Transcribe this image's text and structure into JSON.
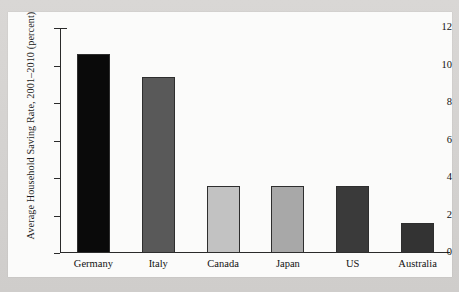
{
  "figure": {
    "background_outer": "#d6d4d2",
    "background_page": "#fbfbfa"
  },
  "chart_data": {
    "type": "bar",
    "title": "",
    "subtitle": "",
    "xlabel": "",
    "ylabel": "Average Household Saving Rate, 2001–2010 (percent)",
    "categories": [
      "Germany",
      "Italy",
      "Canada",
      "Japan",
      "US",
      "Australia"
    ],
    "values": [
      10.6,
      9.4,
      3.55,
      3.55,
      3.6,
      1.6
    ],
    "bar_colors": [
      "#0a0a0a",
      "#595959",
      "#c2c2c2",
      "#a8a8a8",
      "#3a3a3a",
      "#333333"
    ],
    "bar_edge_color": "#2e2e2e",
    "ylim": [
      0,
      12
    ],
    "yticks": [
      0,
      2,
      4,
      6,
      8,
      10,
      12
    ],
    "ytick_labels": [
      "0",
      "2",
      "4",
      "6",
      "8",
      "10",
      "12"
    ],
    "grid": false,
    "legend": false,
    "axis_color": "#2a2a2a"
  }
}
